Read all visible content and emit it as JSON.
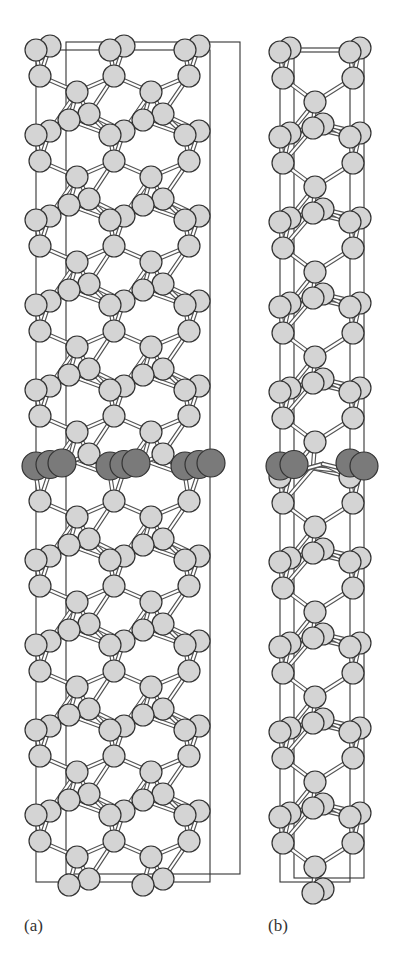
{
  "figure": {
    "panels": [
      {
        "id": "a",
        "label": "(a)",
        "label_x": 24,
        "label_y": 916,
        "box": {
          "x0": 36,
          "x1": 210,
          "y_top": 50,
          "y_bot": 882,
          "depth_dx": 30,
          "depth_dy": -8
        },
        "columns": [
          36,
          110,
          185
        ],
        "view": "wide"
      },
      {
        "id": "b",
        "label": "(b)",
        "label_x": 268,
        "label_y": 916,
        "box": {
          "x0": 280,
          "x1": 350,
          "y_top": 52,
          "y_bot": 882,
          "depth_dx": 14,
          "depth_dy": -4
        },
        "columns": [
          280,
          350
        ],
        "view": "narrow"
      }
    ],
    "colors": {
      "atom_light": "#d4d4d4",
      "atom_dark": "#7a7a7a",
      "atom_stroke": "#333333",
      "bond": "#555555",
      "frame": "#333333"
    },
    "dark_layer_y": 466,
    "layer_period": 85,
    "atom_radius": 11,
    "dark_atom_radius": 14
  }
}
